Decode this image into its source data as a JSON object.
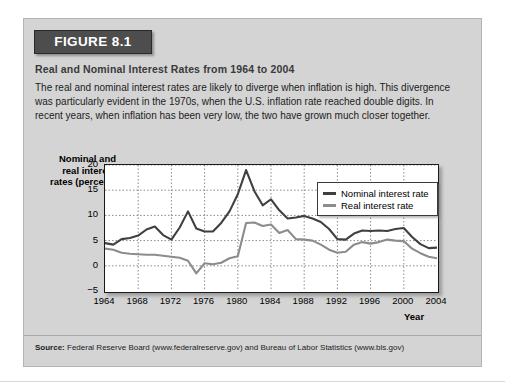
{
  "figure": {
    "banner_label": "FIGURE 8.1",
    "title": "Real and Nominal Interest Rates from 1964 to 2004",
    "caption": "The real and nominal interest rates are likely to diverge when inflation is high. This divergence was particularly evident in the 1970s, when the U.S. inflation rate reached double digits. In recent years, when inflation has been very low, the two have grown much closer together.",
    "source_label": "Source:",
    "source_text": " Federal Reserve Board (www.federalreserve.gov) and Bureau of Labor Statistics (www.bls.gov)"
  },
  "colors": {
    "nominal_line": "#404040",
    "real_line": "#8c8c8c",
    "figure_background": "#d4d4d4",
    "banner_background": "#4d4d4d",
    "plot_background": "#ffffff",
    "grid": "#8a8a8a"
  },
  "chart_data": {
    "type": "line",
    "title": "Real and Nominal Interest Rates from 1964 to 2004",
    "xlabel": "Year",
    "ylabel": "Nominal and real interest rates (percent)",
    "ylabel_lines": [
      "Nominal and",
      "real interest",
      "rates (percent)"
    ],
    "xlim": [
      1964,
      2004
    ],
    "ylim": [
      -5,
      20
    ],
    "xticks": [
      1964,
      1968,
      1972,
      1976,
      1980,
      1984,
      1988,
      1992,
      1996,
      2000,
      2004
    ],
    "yticks": [
      -5,
      0,
      5,
      10,
      15,
      20
    ],
    "ytick_labels": [
      "−5",
      "0",
      "5",
      "10",
      "15",
      "20"
    ],
    "grid": "dotted vertical at xticks and horizontal at yticks",
    "legend_position": "top-right inside plot",
    "x": [
      1964,
      1965,
      1966,
      1967,
      1968,
      1969,
      1970,
      1971,
      1972,
      1973,
      1974,
      1975,
      1976,
      1977,
      1978,
      1979,
      1980,
      1981,
      1982,
      1983,
      1984,
      1985,
      1986,
      1987,
      1988,
      1989,
      1990,
      1991,
      1992,
      1993,
      1994,
      1995,
      1996,
      1997,
      1998,
      1999,
      2000,
      2001,
      2002,
      2003,
      2004
    ],
    "series": [
      {
        "name": "Nominal interest rate",
        "color": "#404040",
        "values": [
          4.5,
          4.2,
          5.3,
          5.5,
          6.0,
          7.2,
          7.8,
          6.1,
          5.2,
          7.6,
          10.8,
          7.4,
          6.8,
          6.8,
          8.5,
          10.8,
          14.2,
          19.0,
          14.8,
          12.0,
          13.2,
          11.0,
          9.4,
          9.6,
          9.9,
          9.4,
          8.7,
          7.3,
          5.3,
          5.2,
          6.4,
          7.0,
          6.9,
          7.0,
          6.9,
          7.3,
          7.5,
          5.7,
          4.3,
          3.5,
          3.6
        ]
      },
      {
        "name": "Real interest rate",
        "color": "#8c8c8c",
        "values": [
          3.4,
          3.2,
          2.6,
          2.4,
          2.3,
          2.2,
          2.2,
          2.0,
          1.8,
          1.6,
          1.0,
          -1.5,
          0.5,
          0.3,
          0.6,
          1.5,
          1.9,
          8.5,
          8.6,
          7.9,
          8.2,
          6.5,
          7.1,
          5.3,
          5.2,
          5.0,
          4.2,
          3.2,
          2.6,
          2.8,
          4.2,
          4.7,
          4.4,
          4.7,
          5.2,
          5.0,
          4.9,
          3.4,
          2.5,
          1.8,
          1.5
        ]
      }
    ]
  }
}
